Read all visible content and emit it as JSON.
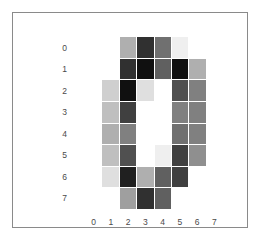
{
  "figure": {
    "background_color": "#ffffff",
    "frame_color": "#8a8a8a",
    "gridline_color": "#ffffff",
    "tick_label_color": "#4a4a4a"
  },
  "chart_data": {
    "type": "heatmap",
    "title": "",
    "xlabel": "",
    "ylabel": "",
    "colormap": "gray_r",
    "vmin": 0,
    "vmax": 16,
    "grid": true,
    "legend": "none",
    "xticklabels": [
      "0",
      "1",
      "2",
      "3",
      "4",
      "5",
      "6",
      "7"
    ],
    "yticklabels": [
      "0",
      "1",
      "2",
      "3",
      "4",
      "5",
      "6",
      "7"
    ],
    "x": [
      0,
      1,
      2,
      3,
      4,
      5,
      6,
      7
    ],
    "y": [
      0,
      1,
      2,
      3,
      4,
      5,
      6,
      7
    ],
    "values": [
      [
        0,
        0,
        5,
        13,
        9,
        1,
        0,
        0
      ],
      [
        0,
        0,
        13,
        15,
        10,
        15,
        5,
        0
      ],
      [
        0,
        3,
        15,
        2,
        0,
        11,
        8,
        0
      ],
      [
        0,
        4,
        12,
        0,
        0,
        8,
        8,
        0
      ],
      [
        0,
        5,
        8,
        0,
        0,
        9,
        8,
        0
      ],
      [
        0,
        4,
        11,
        0,
        1,
        12,
        7,
        0
      ],
      [
        0,
        2,
        14,
        5,
        10,
        12,
        0,
        0
      ],
      [
        0,
        0,
        6,
        13,
        10,
        0,
        0,
        0
      ]
    ]
  }
}
